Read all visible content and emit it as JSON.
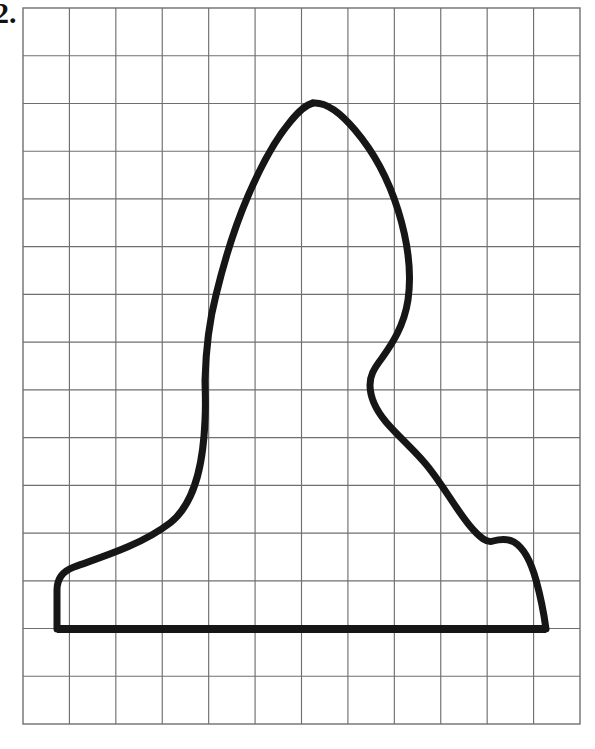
{
  "page": {
    "width": 595,
    "height": 749,
    "background": "#ffffff",
    "problem_label": "2."
  },
  "grid": {
    "x_start": 23,
    "y_start": 8,
    "x_end": 580,
    "y_end": 724,
    "columns": 12,
    "rows": 15,
    "cell_width": 46.4,
    "cell_height": 47.7,
    "line_color": "#6f6f73",
    "line_width": 1.15,
    "border_color": "#6f6f73",
    "border_width": 1.4
  },
  "figure": {
    "name": "vase-silhouette",
    "stroke_color": "#161616",
    "stroke_width": 7,
    "baseline": {
      "y": 629,
      "x_left": 57,
      "x_right": 546,
      "stroke_width": 8
    },
    "apex": {
      "x": 313,
      "y": 103
    },
    "left_waist": {
      "x": 205,
      "y": 383
    },
    "right_waist": {
      "x": 370,
      "y": 383
    },
    "right_notch": {
      "x": 493,
      "y": 540
    },
    "left_foot": {
      "x": 57,
      "y": 588
    },
    "right_foot": {
      "x": 546,
      "y": 600
    },
    "left_path": "M 57 629 L 57 590 C 57 578 63 571 74 567 C 98 558 140 546 170 523 C 193 505 203 470 205 420 C 206 400 205 390 205 380 C 206 345 210 318 216 295 C 224 262 235 226 248 196 C 260 168 275 140 290 122 C 298 112 305 105 313 103",
    "right_path": "M 313 103 C 325 102 340 112 355 130 C 372 150 388 178 398 210 C 408 242 412 272 408 300 C 404 326 392 344 382 358 C 373 370 370 376 370 385 C 370 398 376 410 386 422 C 398 436 412 448 424 462 C 440 480 455 508 470 526 C 480 538 487 543 493 541 C 500 539 507 538 514 542 C 524 548 531 562 536 580 C 541 598 544 614 546 629"
  },
  "chart_data": {
    "type": "line",
    "title": "",
    "xlabel": "",
    "ylabel": "",
    "grid": true,
    "legend": null,
    "note": "Hand-drawn closed silhouette (vase/lamp profile) traced over 12x15 graph-paper squares",
    "grid_units": {
      "columns": 12,
      "rows": 15
    },
    "silhouette_points_grid": [
      [
        0.73,
        13.0
      ],
      [
        0.73,
        12.2
      ],
      [
        1.05,
        11.9
      ],
      [
        3.17,
        10.8
      ],
      [
        3.92,
        8.8
      ],
      [
        3.92,
        7.8
      ],
      [
        4.15,
        6.0
      ],
      [
        4.85,
        3.9
      ],
      [
        5.8,
        2.0
      ],
      [
        6.25,
        1.99
      ],
      [
        7.38,
        3.0
      ],
      [
        8.3,
        5.1
      ],
      [
        8.3,
        7.8
      ],
      [
        7.48,
        8.8
      ],
      [
        8.65,
        11.0
      ],
      [
        10.12,
        12.2
      ],
      [
        11.28,
        13.0
      ]
    ]
  }
}
